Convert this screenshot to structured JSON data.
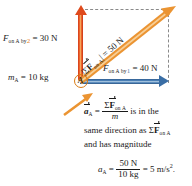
{
  "figure": {
    "name": "newtons-second-law-vector-diagram",
    "particle": {
      "label": "A",
      "mass_label_prefix": "m",
      "mass_label_sub": "A",
      "mass_label_value": "= 10 kg"
    },
    "forces": [
      {
        "id": "force-by-2",
        "symbol": "F",
        "sub": "on A by",
        "index": "2",
        "value": "= 30 N",
        "direction": "up",
        "color": "#df4a1c",
        "magnitude_n": 30
      },
      {
        "id": "force-by-1",
        "symbol": "F",
        "sub": "on A by",
        "index": "1",
        "value": "= 40 N",
        "direction": "right",
        "color": "#3a6ea5",
        "magnitude_n": 40
      }
    ],
    "resultant": {
      "id": "net-force",
      "label_open": "|Σ",
      "label_symbol": "F",
      "label_sub": "on A",
      "label_close": "| = 50 N",
      "magnitude_n": 50,
      "color": "#eb9432",
      "angle_deg": 41
    },
    "caption": {
      "line1_a_symbol": "a",
      "line1_a_sub": "A",
      "line1_equals": "=",
      "line1_frac_num_sigma": "Σ",
      "line1_frac_num_symbol": "F",
      "line1_frac_num_sub": "on A",
      "line1_frac_den": "m",
      "line1_tail": "is in the",
      "line2_head": "same direction as",
      "line2_sigma": "Σ",
      "line2_symbol": "F",
      "line2_sub": "on A",
      "line3": "and has magnitude",
      "line4_a_symbol": "a",
      "line4_a_sub": "A",
      "line4_equals": "=",
      "line4_num": "50 N",
      "line4_den": "10 kg",
      "line4_result": "= 5 m/s",
      "line4_exp": "2",
      "line4_period": "."
    },
    "construction": {
      "dashed_top": true,
      "dashed_right": true,
      "dashed_color": "#8a8a8a"
    }
  }
}
